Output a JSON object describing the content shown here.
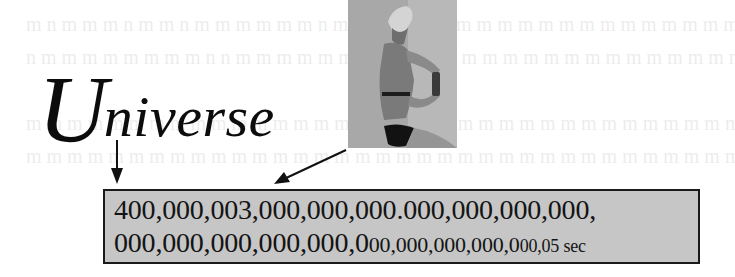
{
  "heading": {
    "initial": "U",
    "rest": "niverse"
  },
  "figure": {
    "image_alt": "illustration-of-woman-in-bikini-holding-bottle"
  },
  "arrows": [
    {
      "name": "down-arrow",
      "direction": "down"
    },
    {
      "name": "diagonal-arrow",
      "direction": "down-left"
    }
  ],
  "number_box": {
    "line1": "400,000,003,000,000,000.000,000,000,000,",
    "line2_main": "000,000,000,000,000,0",
    "line2_small": "00,000,000,000,0",
    "line2_tiny": "00,05 sec"
  },
  "colors": {
    "box_fill": "#c6c6c6",
    "box_border": "#1a1a1a",
    "text": "#141414"
  }
}
